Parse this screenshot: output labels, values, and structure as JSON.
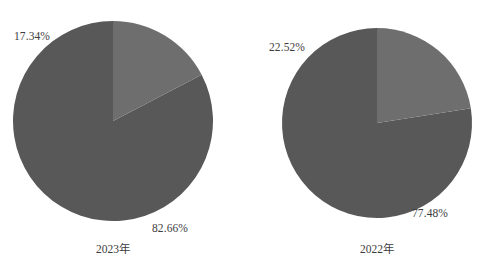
{
  "figure": {
    "background_color": "#ffffff",
    "text_color": "#3d3d3d"
  },
  "palette": {
    "major_slice_color": "#585858",
    "minor_slice_color": "#6e6e6e"
  },
  "chart_data": [
    {
      "type": "pie",
      "title": "2023年",
      "categories": [
        "82.66%",
        "17.34%"
      ],
      "values": [
        82.66,
        17.34
      ],
      "labels": [
        "82.66%",
        "17.34%"
      ],
      "colors": [
        "#585858",
        "#6e6e6e"
      ],
      "start_angle_deg": 90,
      "direction": "counterclockwise",
      "legend": "none",
      "grid": false,
      "label_major": "82.66%",
      "label_minor": "17.34%",
      "caption": "2023年"
    },
    {
      "type": "pie",
      "title": "2022年",
      "categories": [
        "77.48%",
        "22.52%"
      ],
      "values": [
        77.48,
        22.52
      ],
      "labels": [
        "77.48%",
        "22.52%"
      ],
      "colors": [
        "#585858",
        "#6e6e6e"
      ],
      "start_angle_deg": 90,
      "direction": "counterclockwise",
      "legend": "none",
      "grid": false,
      "label_major": "77.48%",
      "label_minor": "22.52%",
      "caption": "2022年"
    }
  ]
}
